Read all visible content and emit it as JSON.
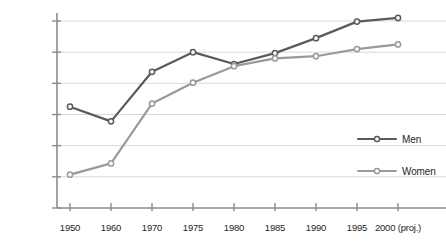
{
  "chart_data": {
    "type": "line",
    "title": "",
    "subtitle": "",
    "xlabel": "",
    "ylabel": "",
    "x": [
      "1950",
      "1960",
      "1970",
      "1975",
      "1980",
      "1985",
      "1990",
      "1995",
      "2000 (proj.)"
    ],
    "xtick_labels": [
      "1950",
      "1960",
      "1970",
      "1975",
      "1980",
      "1985",
      "1990",
      "1995",
      "2000 (proj.)"
    ],
    "ytick_labels": [
      "0",
      "100,000",
      "200,000",
      "300,000",
      "400,000",
      "500,000",
      "600,000"
    ],
    "ytick_values": [
      0,
      100000,
      200000,
      300000,
      400000,
      500000,
      600000
    ],
    "ylim": [
      0,
      645000
    ],
    "grid": true,
    "grid_axis": "y",
    "legend_position": "right-middle",
    "series": [
      {
        "name": "Men",
        "color": "#5a5a5a",
        "marker": "circle-open",
        "values": [
          325000,
          278000,
          437000,
          500000,
          462000,
          497000,
          545000,
          598000,
          610000
        ]
      },
      {
        "name": "Women",
        "color": "#9a9a9a",
        "marker": "circle-open",
        "values": [
          107000,
          143000,
          335000,
          402000,
          455000,
          480000,
          487000,
          510000,
          525000
        ]
      }
    ],
    "legend_entries": [
      {
        "label": "Men",
        "color": "#5a5a5a"
      },
      {
        "label": "Women",
        "color": "#9a9a9a"
      }
    ]
  },
  "colors": {
    "men": "#5a5a5a",
    "women": "#9a9a9a",
    "axis": "#8c8c8c",
    "grid": "#d9d9d9",
    "text": "#231f20",
    "marker_fill": "#ffffff"
  }
}
